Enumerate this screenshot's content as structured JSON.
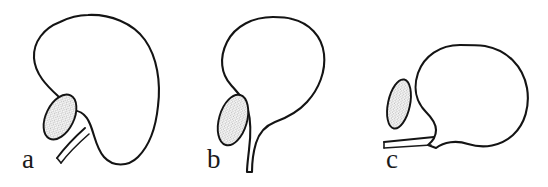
{
  "figure": {
    "background_color": "#ffffff",
    "stroke_color": "#141414",
    "gland_fill_color": "#d9d9d9",
    "label_color": "#1a1a1a",
    "panel_count": 3
  },
  "panels": [
    {
      "id": "a",
      "label": "a",
      "shape_name": "kidney-bean-shaped-organ",
      "description": "Elongated obliquely oriented organ with concave indentation on lower-left, stippled oval gland set into the notch, and a slender duct extending down-left",
      "gland": {
        "name": "stippled-oval-gland",
        "fill": "#d9d9d9"
      },
      "duct": {
        "name": "duct-tube",
        "orientation": "down-left"
      }
    },
    {
      "id": "b",
      "label": "b",
      "shape_name": "pear-shaped-organ",
      "description": "Rounded organ tapering to a funnel that narrows into a long vertical duct, with stippled oval gland on the left shoulder of the funnel",
      "gland": {
        "name": "stippled-oval-gland",
        "fill": "#d9d9d9"
      },
      "duct": {
        "name": "duct-tube",
        "orientation": "vertical-down"
      }
    },
    {
      "id": "c",
      "label": "c",
      "shape_name": "spherical-organ",
      "description": "Nearly circular organ with a short pointed beak at lower-left leading into a horizontal duct, stippled oval gland positioned free at the left",
      "gland": {
        "name": "stippled-oval-gland",
        "fill": "#d9d9d9"
      },
      "duct": {
        "name": "duct-tube",
        "orientation": "horizontal-left"
      }
    }
  ]
}
